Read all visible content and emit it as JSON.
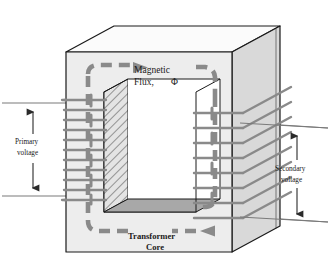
{
  "figure": {
    "background_color": "#ffffff"
  },
  "labels": {
    "flux_line1": "Magnetic",
    "flux_line2": "Flux,",
    "flux_symbol": "Φ",
    "primary_line1": "Primary",
    "primary_line2": "voltage",
    "secondary_line1": "Secondary",
    "secondary_line2": "voltage",
    "core_line1": "Transformer",
    "core_line2": "Core"
  },
  "colors": {
    "outline": "#1a1a1a",
    "core_front_face": "#ededed",
    "core_top_face": "#fbfbfb",
    "core_side_face": "#d9d9d9",
    "window_ledge": "#a8a8a8",
    "hatch_stroke": "#555555",
    "winding": "#8a8a8a",
    "flux_arrow": "#8a8a8a",
    "lead_line": "#7a7a7a",
    "text": "#1a1a1a"
  },
  "geometry": {
    "core_front_left_x": 66,
    "core_front_right_x": 232,
    "core_front_top_y": 52,
    "core_front_bottom_y": 252,
    "depth_dx": 48,
    "depth_dy": -26,
    "window_left_x": 104,
    "window_right_x": 196,
    "window_top_y": 92,
    "window_bottom_y": 212
  },
  "windings": {
    "primary": {
      "name": "primary-winding",
      "turn_count": 11,
      "side": "left"
    },
    "secondary": {
      "name": "secondary-winding",
      "turn_count": 8,
      "side": "right"
    }
  },
  "flux": {
    "direction": "clockwise",
    "style": "dashed-arc-with-arrowheads",
    "arrowheads": [
      "top-right",
      "bottom-left"
    ]
  },
  "leads": {
    "primary": {
      "top_y": 103,
      "bottom_y": 196,
      "arrow": "double-headed-vertical"
    },
    "secondary": {
      "top_y": 128,
      "bottom_y": 222,
      "arrow": "double-headed-vertical"
    }
  }
}
